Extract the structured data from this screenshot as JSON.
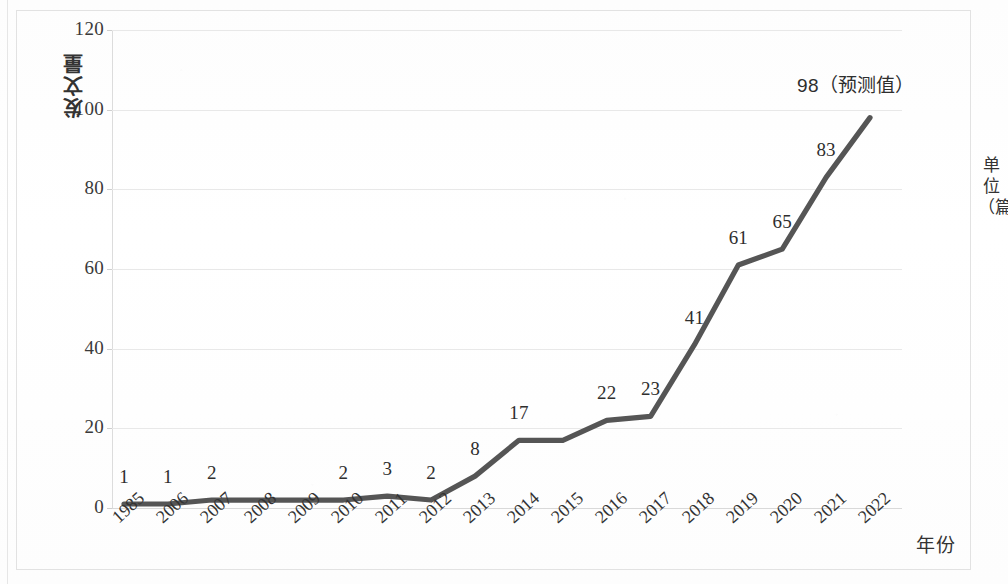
{
  "axis_titles": {
    "y": "发文量",
    "x": "年份",
    "unit_line1": "单",
    "unit_line2": "位",
    "unit_line3": "（篇）"
  },
  "chart_data": {
    "type": "line",
    "title": "",
    "subtitle": "",
    "xlabel": "年份",
    "ylabel": "发文量",
    "unit_label": "单位（篇）",
    "categories": [
      "1985",
      "2006",
      "2007",
      "2008",
      "2009",
      "2010",
      "2011",
      "2012",
      "2013",
      "2014",
      "2015",
      "2016",
      "2017",
      "2018",
      "2019",
      "2020",
      "2021",
      "2022"
    ],
    "values": [
      1,
      1,
      2,
      2,
      2,
      2,
      3,
      2,
      8,
      17,
      17,
      22,
      23,
      41,
      61,
      65,
      83,
      98
    ],
    "point_labels": [
      "1",
      "1",
      "2",
      "",
      "",
      "2",
      "3",
      "2",
      "8",
      "17",
      "",
      "22",
      "23",
      "41",
      "61",
      "65",
      "83",
      "98（预测值）"
    ],
    "ylim": [
      0,
      120
    ],
    "ytick_values": [
      0,
      20,
      40,
      60,
      80,
      100,
      120
    ],
    "ytick_labels": [
      "0",
      "20",
      "40",
      "60",
      "80",
      "100",
      "120"
    ],
    "grid": true,
    "legend": "none",
    "series_color": "#555555",
    "gridline_color": "#e8e8e8",
    "forecast_note": "（预测值）",
    "forecast_year": "2022",
    "forecast_value": "98"
  }
}
